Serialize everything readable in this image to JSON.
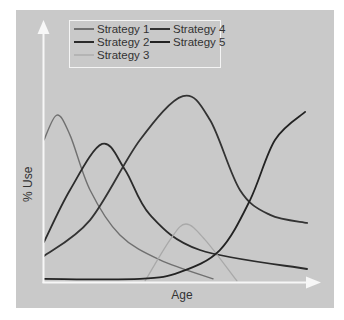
{
  "chart_data": {
    "type": "line",
    "title": "",
    "xlabel": "Age",
    "ylabel": "% Use",
    "xlim": [
      0,
      100
    ],
    "ylim": [
      0,
      100
    ],
    "grid": false,
    "ticks": "none",
    "legend_position": "top-left inside",
    "legend": [
      "Strategy 1",
      "Strategy 2",
      "Strategy 3",
      "Strategy 4",
      "Strategy 5"
    ],
    "series": [
      {
        "name": "Strategy 1",
        "color": "#707070",
        "width": 1.4,
        "x": [
          0,
          4.7,
          9.5,
          16.8,
          27.7,
          42.3,
          61.7
        ],
        "y": [
          54.6,
          64.2,
          56.5,
          35.4,
          18.1,
          8.5,
          1.2
        ]
      },
      {
        "name": "Strategy 2",
        "color": "#2b2b2b",
        "width": 1.8,
        "x": [
          0,
          9.5,
          21.2,
          29.6,
          38.7,
          56.9,
          96.0
        ],
        "y": [
          15.4,
          35.4,
          53.1,
          43.1,
          25.8,
          12.3,
          5.0
        ]
      },
      {
        "name": "Strategy 3",
        "color": "#a9a9a9",
        "width": 1.3,
        "x": [
          36.9,
          46.0,
          51.8,
          58.8,
          70.4
        ],
        "y": [
          0.4,
          16.2,
          22.3,
          16.2,
          0.4
        ]
      },
      {
        "name": "Strategy 4",
        "color": "#333333",
        "width": 1.8,
        "x": [
          0,
          16.8,
          35.0,
          50.7,
          60.6,
          71.5,
          82.5,
          96.0
        ],
        "y": [
          10.0,
          23.8,
          54.6,
          71.5,
          62.3,
          35.4,
          25.8,
          22.7
        ]
      },
      {
        "name": "Strategy 5",
        "color": "#222222",
        "width": 1.8,
        "x": [
          0,
          35.0,
          49.6,
          64.2,
          75.2,
          84.3,
          95.3
        ],
        "y": [
          1.2,
          1.2,
          3.8,
          12.3,
          31.5,
          54.6,
          65.4
        ]
      }
    ]
  },
  "legend": {
    "items": [
      {
        "label": "Strategy 1",
        "color": "#707070"
      },
      {
        "label": "Strategy 2",
        "color": "#2b2b2b"
      },
      {
        "label": "Strategy 3",
        "color": "#a9a9a9"
      },
      {
        "label": "Strategy 4",
        "color": "#333333"
      },
      {
        "label": "Strategy 5",
        "color": "#222222"
      }
    ]
  },
  "axes": {
    "x_label": "Age",
    "y_label": "% Use",
    "axis_color": "#f7f7f7"
  },
  "colors": {
    "panel_bg": "#c9c9c9"
  }
}
